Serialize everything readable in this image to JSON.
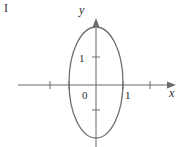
{
  "figure": {
    "panel_letter": "I",
    "background_color": "#ffffff",
    "curve_color": "#6e6e6e",
    "axis_color": "#6b6b6b",
    "text_color": "#2b2b2b",
    "width": 188,
    "height": 147
  },
  "axes": {
    "x_axis_label": "x",
    "y_axis_label": "y",
    "origin_label": "0",
    "x_tick_label": "1",
    "y_tick_label": "1",
    "x_axis_y_px": 85,
    "y_axis_x_px": 96,
    "x_axis_start_px": 18,
    "x_axis_end_px": 176,
    "y_axis_start_px": 18,
    "y_axis_end_px": 147,
    "x_ticks_px": [
      50,
      69,
      123,
      150
    ],
    "y_ticks_px": [
      57,
      110
    ],
    "tick_half_length": 4
  },
  "chart_data": {
    "type": "line",
    "title": "",
    "xlabel": "x",
    "ylabel": "y",
    "grid": false,
    "legend": null,
    "curve_name": "ellipse",
    "center": [
      0,
      0
    ],
    "semi_axis_x": 0.5,
    "semi_axis_y": 2.0,
    "equation": "x^2/0.5^2 + y^2/2^2 = 1",
    "x_intercepts": [
      -0.5,
      0.5
    ],
    "y_intercepts": [
      -2,
      2
    ],
    "xlim": [
      -1.45,
      1.5
    ],
    "ylim": [
      -2.3,
      2.4
    ],
    "labeled_x_ticks": [
      1
    ],
    "labeled_y_ticks": [
      1
    ],
    "unlabeled_x_ticks": [
      -1,
      -0.5,
      0.5
    ],
    "unlabeled_y_ticks": [
      -1
    ]
  },
  "geometry": {
    "ellipse_center_x_px": 96,
    "ellipse_center_y_px": 82.5,
    "ellipse_rx_px": 27,
    "ellipse_ry_px": 55.5,
    "ellipse_stroke_width": 1.3
  },
  "label_positions": {
    "panel_letter": {
      "x": 4,
      "y": 12
    },
    "y_label": {
      "x": 79,
      "y": 14
    },
    "x_label": {
      "x": 169,
      "y": 97
    },
    "origin": {
      "x": 82,
      "y": 99
    },
    "x_one": {
      "x": 125,
      "y": 99
    },
    "y_one": {
      "x": 79,
      "y": 62
    }
  }
}
